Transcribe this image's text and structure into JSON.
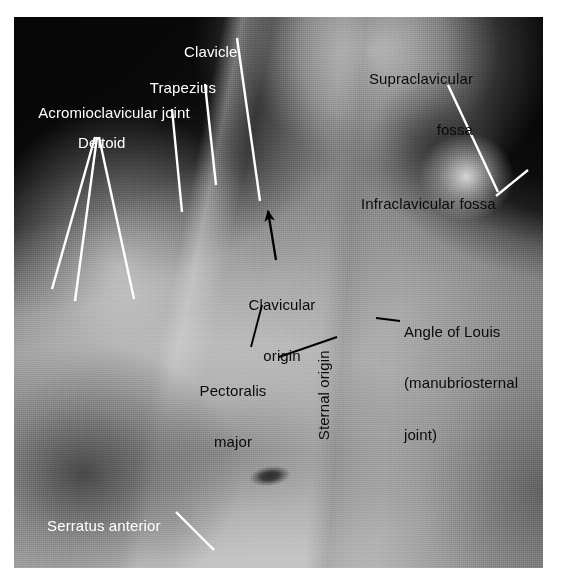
{
  "figure": {
    "kind": "annotated-anatomical-photograph",
    "background_color": "#ffffff",
    "photo_tone": "grayscale"
  },
  "labels": {
    "acromioclavicular_joint": "Acromioclavicular joint",
    "deltoid": "Deltoid",
    "trapezius": "Trapezius",
    "clavicle": "Clavicle",
    "supraclavicular_fossa_line1": "Supraclavicular",
    "supraclavicular_fossa_line2": "fossa",
    "infraclavicular_fossa": "Infraclavicular fossa",
    "clavicular_origin_line1": "Clavicular",
    "clavicular_origin_line2": "origin",
    "pectoralis_major_line1": "Pectoralis",
    "pectoralis_major_line2": "major",
    "sternal_origin": "Sternal origin",
    "angle_of_louis_line1": "Angle of Louis",
    "angle_of_louis_line2": "(manubriosternal",
    "angle_of_louis_line3": "joint)",
    "serratus_anterior": "Serratus anterior"
  },
  "colors": {
    "label_dark": "#0a0a0a",
    "label_light": "#ffffff",
    "leader_light": "#ffffff",
    "leader_dark": "#000000",
    "page_background": "#ffffff"
  },
  "leaders": {
    "acromioclavicular_joint": {
      "style": "white-line",
      "from": [
        172,
        109
      ],
      "to": [
        182,
        212
      ]
    },
    "deltoid_fan": [
      {
        "style": "white-line",
        "from": [
          95,
          137
        ],
        "to": [
          52,
          289
        ]
      },
      {
        "style": "white-line",
        "from": [
          97,
          137
        ],
        "to": [
          75,
          301
        ]
      },
      {
        "style": "white-line",
        "from": [
          99,
          137
        ],
        "to": [
          134,
          299
        ]
      }
    ],
    "trapezius": {
      "style": "white-line",
      "from": [
        205,
        84
      ],
      "to": [
        216,
        185
      ]
    },
    "clavicle": {
      "style": "white-line",
      "from": [
        237,
        38
      ],
      "to": [
        260,
        201
      ]
    },
    "supraclavicular_fossa": {
      "style": "white-line",
      "from": [
        448,
        85
      ],
      "to": [
        498,
        192
      ]
    },
    "infraclavicular_fossa": {
      "style": "white-line",
      "from": [
        496,
        196
      ],
      "to": [
        528,
        170
      ]
    },
    "clavicular_origin": {
      "style": "black-arrow",
      "from": [
        276,
        260
      ],
      "to": [
        268,
        207
      ]
    },
    "pectoralis_major_to_clavicular_origin": {
      "style": "black-line",
      "from": [
        262,
        305
      ],
      "to": [
        251,
        347
      ]
    },
    "pectoralis_major_to_sternal_origin": {
      "style": "black-line",
      "from": [
        279,
        357
      ],
      "to": [
        337,
        337
      ]
    },
    "angle_of_louis": {
      "style": "black-line",
      "from": [
        400,
        322
      ],
      "to": [
        378,
        319
      ]
    }
  },
  "label_positions": {
    "acromioclavicular_joint": [
      22,
      87
    ],
    "deltoid": [
      61,
      117
    ],
    "trapezius": [
      133,
      62
    ],
    "clavicle": [
      167,
      26
    ],
    "supraclavicular_fossa": [
      333,
      36
    ],
    "infraclavicular_fossa": [
      344,
      178
    ],
    "clavicular_origin": [
      254,
      262
    ],
    "pectoralis_major": [
      196,
      348
    ],
    "sternal_origin": [
      349,
      406
    ],
    "angle_of_louis": [
      404,
      289
    ],
    "serratus_anterior": [
      30,
      500
    ]
  }
}
